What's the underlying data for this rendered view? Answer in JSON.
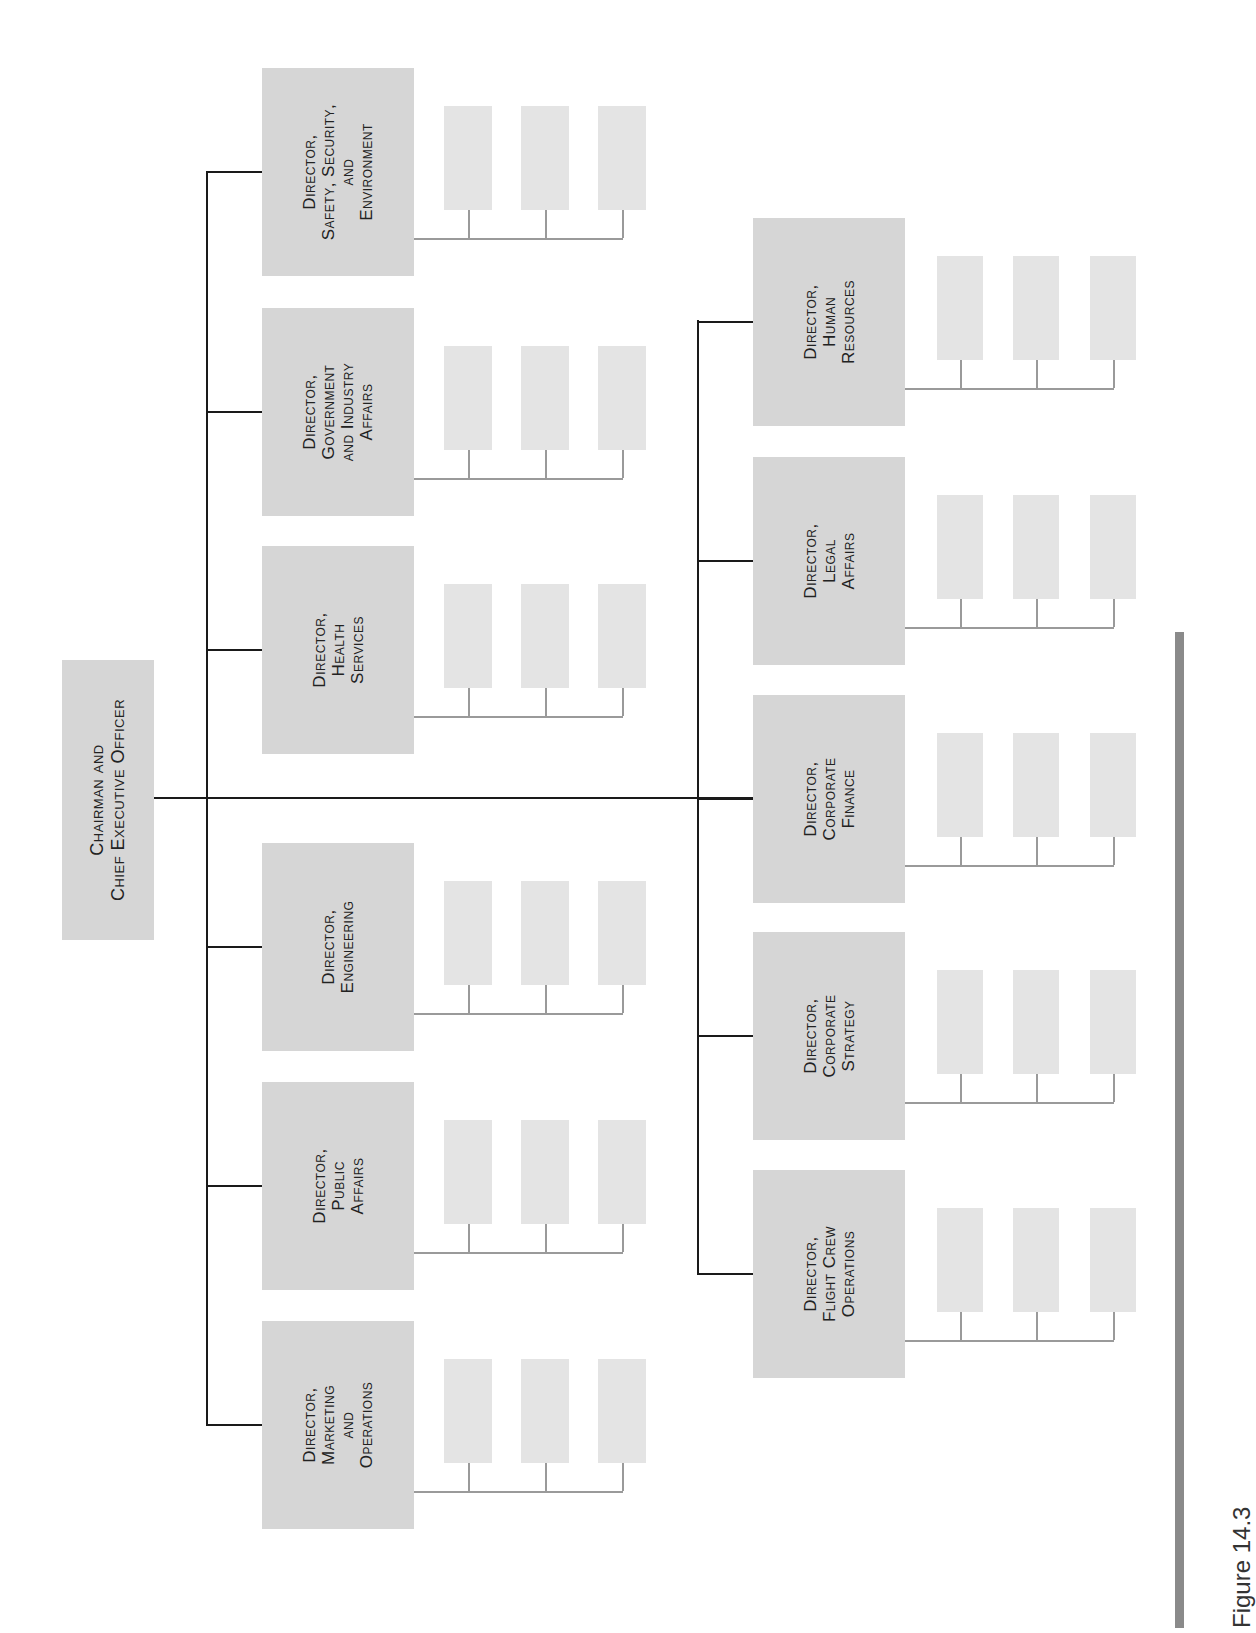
{
  "figure": {
    "caption": "Figure 14.3"
  },
  "chart_data": {
    "type": "org-chart",
    "title": "Figure 14.3",
    "root": {
      "label_lines": [
        "Chairman and",
        "Chief Executive Officer"
      ]
    },
    "branches": [
      {
        "group": "upper",
        "directors": [
          {
            "label_lines": [
              "Director,",
              "Safety, Security,",
              "and",
              "Environment"
            ],
            "subordinates": 3
          },
          {
            "label_lines": [
              "Director,",
              "Government",
              "and Industry",
              "Affairs"
            ],
            "subordinates": 3
          },
          {
            "label_lines": [
              "Director,",
              "Health",
              "Services"
            ],
            "subordinates": 3
          },
          {
            "label_lines": [
              "Director,",
              "Engineering"
            ],
            "subordinates": 3
          },
          {
            "label_lines": [
              "Director,",
              "Public",
              "Affairs"
            ],
            "subordinates": 3
          },
          {
            "label_lines": [
              "Director,",
              "Marketing",
              "and",
              "Operations"
            ],
            "subordinates": 3
          }
        ]
      },
      {
        "group": "lower",
        "directors": [
          {
            "label_lines": [
              "Director,",
              "Human",
              "Resources"
            ],
            "subordinates": 3
          },
          {
            "label_lines": [
              "Director,",
              "Legal",
              "Affairs"
            ],
            "subordinates": 3
          },
          {
            "label_lines": [
              "Director,",
              "Corporate",
              "Finance"
            ],
            "subordinates": 3
          },
          {
            "label_lines": [
              "Director,",
              "Corporate",
              "Strategy"
            ],
            "subordinates": 3
          },
          {
            "label_lines": [
              "Director,",
              "Flight Crew",
              "Operations"
            ],
            "subordinates": 3
          }
        ]
      }
    ]
  },
  "colors": {
    "box": "#d6d6d6",
    "subbox": "#e4e4e4",
    "line_primary": "#1a1a1a",
    "line_secondary": "#9a9a9a",
    "accent_bar": "#8a8a8a"
  }
}
